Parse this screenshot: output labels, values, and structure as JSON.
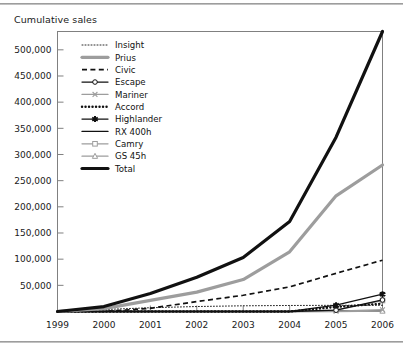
{
  "title": "Cumulative sales",
  "colors": {
    "black": "#111111",
    "gray": "#9d9d9d",
    "frame": "#808080",
    "rule": "#8c8c8c",
    "text": "#1a1a1a"
  },
  "axis": {
    "y_ticks": [
      "50,000",
      "100,000",
      "150,000",
      "200,000",
      "250,000",
      "300,000",
      "350,000",
      "400,000",
      "450,000",
      "500,000"
    ],
    "x_ticks": [
      "1999",
      "2000",
      "2001",
      "2002",
      "2003",
      "2004",
      "2005",
      "2006"
    ]
  },
  "legend": {
    "items": [
      {
        "label": "Insight",
        "style": "dotted-thin",
        "color": "#111111",
        "marker": "none"
      },
      {
        "label": "Prius",
        "style": "solid-thick",
        "color": "#9d9d9d",
        "marker": "none"
      },
      {
        "label": "Civic",
        "style": "dashed",
        "color": "#111111",
        "marker": "none"
      },
      {
        "label": "Escape",
        "style": "solid-thin",
        "color": "#111111",
        "marker": "circle-open"
      },
      {
        "label": "Mariner",
        "style": "solid-thin",
        "color": "#9d9d9d",
        "marker": "cross"
      },
      {
        "label": "Accord",
        "style": "dotted-thick",
        "color": "#111111",
        "marker": "none"
      },
      {
        "label": "Highlander",
        "style": "solid-thin",
        "color": "#111111",
        "marker": "star"
      },
      {
        "label": "RX 400h",
        "style": "solid-thin",
        "color": "#111111",
        "marker": "none"
      },
      {
        "label": "Camry",
        "style": "solid-thin",
        "color": "#9d9d9d",
        "marker": "square-open"
      },
      {
        "label": "GS 45h",
        "style": "solid-thin",
        "color": "#9d9d9d",
        "marker": "triangle-open"
      },
      {
        "label": "Total",
        "style": "solid-thick",
        "color": "#111111",
        "marker": "none"
      }
    ]
  },
  "chart_data": {
    "type": "line",
    "title": "Cumulative sales",
    "xlabel": "",
    "ylabel": "Cumulative sales",
    "grid": false,
    "legend_position": "inside-top-left",
    "x": [
      1999,
      2000,
      2001,
      2002,
      2003,
      2004,
      2005,
      2006
    ],
    "xlim": [
      1999,
      2006
    ],
    "ylim": [
      0,
      535000
    ],
    "ytick_values": [
      50000,
      100000,
      150000,
      200000,
      250000,
      300000,
      350000,
      400000,
      450000,
      500000
    ],
    "series": [
      {
        "name": "Insight",
        "values": [
          17,
          3800,
          7200,
          9500,
          10900,
          11500,
          11800,
          11900
        ]
      },
      {
        "name": "Prius",
        "values": [
          0,
          5600,
          21200,
          37000,
          61000,
          114000,
          221000,
          280000
        ]
      },
      {
        "name": "Civic",
        "values": [
          0,
          0,
          6100,
          19000,
          31000,
          47000,
          73000,
          98000
        ]
      },
      {
        "name": "Escape",
        "values": [
          0,
          0,
          0,
          0,
          0,
          0,
          2500,
          22000
        ]
      },
      {
        "name": "Mariner",
        "values": [
          0,
          0,
          0,
          0,
          0,
          0,
          500,
          3300
        ]
      },
      {
        "name": "Accord",
        "values": [
          0,
          0,
          0,
          0,
          0,
          0,
          8800,
          14900
        ]
      },
      {
        "name": "Highlander",
        "values": [
          0,
          0,
          0,
          0,
          0,
          0,
          12000,
          33000
        ]
      },
      {
        "name": "RX 400h",
        "values": [
          0,
          0,
          0,
          0,
          0,
          0,
          1500,
          1500
        ]
      },
      {
        "name": "Camry",
        "values": [
          0,
          0,
          0,
          0,
          0,
          0,
          2500,
          21000
        ]
      },
      {
        "name": "GS 45h",
        "values": [
          0,
          0,
          0,
          0,
          0,
          0,
          0,
          1000
        ]
      },
      {
        "name": "Total",
        "values": [
          17,
          9400,
          34500,
          65500,
          103000,
          172000,
          333000,
          535000
        ]
      }
    ]
  }
}
